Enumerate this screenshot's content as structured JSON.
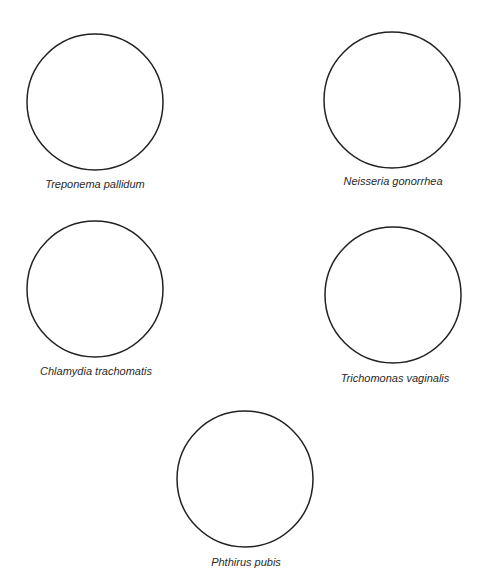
{
  "diagram": {
    "stroke_color": "#222222",
    "background": "#ffffff",
    "organisms": [
      {
        "name": "Treponema pallidum",
        "cx": 95,
        "cy": 102,
        "r": 68,
        "label_x": 95,
        "label_y": 184
      },
      {
        "name": "Neisseria gonorrhea",
        "cx": 392,
        "cy": 100,
        "r": 68,
        "label_x": 393,
        "label_y": 181
      },
      {
        "name": "Chlamydia trachomatis",
        "cx": 95,
        "cy": 289,
        "r": 68,
        "label_x": 96,
        "label_y": 371
      },
      {
        "name": "Trichomonas vaginalis",
        "cx": 393,
        "cy": 295,
        "r": 68,
        "label_x": 395,
        "label_y": 378
      },
      {
        "name": "Phthirus pubis",
        "cx": 245,
        "cy": 479,
        "r": 68,
        "label_x": 246,
        "label_y": 562
      }
    ]
  }
}
